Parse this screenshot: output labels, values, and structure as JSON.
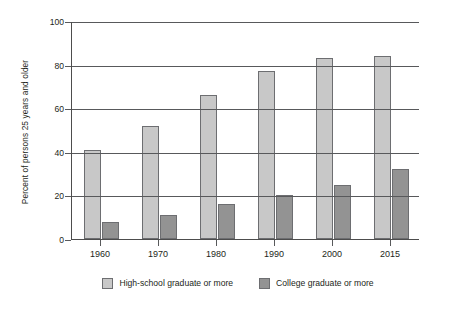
{
  "chart_data": {
    "type": "bar",
    "title": "",
    "xlabel": "",
    "ylabel": "Percent of persons 25 years and older",
    "categories": [
      "1960",
      "1970",
      "1980",
      "1990",
      "2000",
      "2015"
    ],
    "series": [
      {
        "name": "High-school graduate or more",
        "color": "#c8c8c8",
        "values": [
          41,
          52,
          66,
          77,
          83,
          84
        ]
      },
      {
        "name": "College graduate or more",
        "color": "#939393",
        "values": [
          8,
          11,
          16,
          20,
          25,
          32
        ]
      }
    ],
    "ylim": [
      0,
      100
    ],
    "yticks": [
      0,
      20,
      40,
      60,
      80,
      100
    ],
    "grid": true,
    "legend_position": "bottom"
  }
}
